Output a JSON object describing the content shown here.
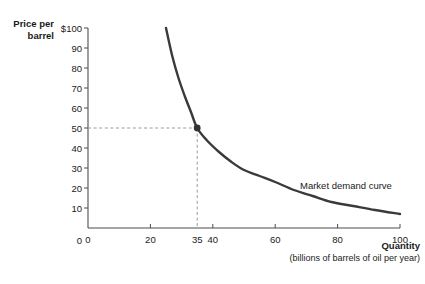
{
  "chart_data": {
    "type": "line",
    "title": "",
    "xlabel": "Quantity",
    "xlabel_sub": "(billions of barrels of oil per year)",
    "ylabel": "Price per\nbarrel",
    "xlim": [
      0,
      100
    ],
    "ylim": [
      0,
      100
    ],
    "grid": false,
    "legend_position": "inline-annotation",
    "annotations": [
      {
        "name": "market-demand-curve-label",
        "text": "Market demand curve",
        "x": 66,
        "y": 22
      }
    ],
    "x_ticks": [
      {
        "value": 0,
        "label": "0",
        "has_mark": false
      },
      {
        "value": 20,
        "label": "20",
        "has_mark": true
      },
      {
        "value": 35,
        "label": "35",
        "has_mark": false
      },
      {
        "value": 40,
        "label": "40",
        "has_mark": true
      },
      {
        "value": 60,
        "label": "60",
        "has_mark": true
      },
      {
        "value": 80,
        "label": "80",
        "has_mark": true
      },
      {
        "value": 100,
        "label": "100",
        "has_mark": true
      }
    ],
    "y_ticks": [
      {
        "value": 100,
        "label": "$100"
      },
      {
        "value": 90,
        "label": "90"
      },
      {
        "value": 80,
        "label": "80"
      },
      {
        "value": 70,
        "label": "70"
      },
      {
        "value": 60,
        "label": "60"
      },
      {
        "value": 50,
        "label": "50"
      },
      {
        "value": 40,
        "label": "40"
      },
      {
        "value": 30,
        "label": "30"
      },
      {
        "value": 20,
        "label": "20"
      },
      {
        "value": 10,
        "label": "10"
      },
      {
        "value": 0,
        "label": "0"
      }
    ],
    "series": [
      {
        "name": "Market demand curve",
        "color": "#3a3a3a",
        "points": [
          {
            "x": 25,
            "y": 100
          },
          {
            "x": 27,
            "y": 86
          },
          {
            "x": 29,
            "y": 75
          },
          {
            "x": 31,
            "y": 66
          },
          {
            "x": 33,
            "y": 58
          },
          {
            "x": 35,
            "y": 50
          },
          {
            "x": 38,
            "y": 44
          },
          {
            "x": 42,
            "y": 38
          },
          {
            "x": 46,
            "y": 33
          },
          {
            "x": 50,
            "y": 29
          },
          {
            "x": 55,
            "y": 26
          },
          {
            "x": 60,
            "y": 23
          },
          {
            "x": 66,
            "y": 19
          },
          {
            "x": 72,
            "y": 16
          },
          {
            "x": 78,
            "y": 13
          },
          {
            "x": 85,
            "y": 11
          },
          {
            "x": 92,
            "y": 9
          },
          {
            "x": 100,
            "y": 7
          }
        ]
      }
    ],
    "highlight_point": {
      "name": "equilibrium-point",
      "x": 35,
      "y": 50,
      "x_label": "35",
      "y_label": "50",
      "color": "#333333"
    },
    "guide_lines": {
      "horizontal_value": 50,
      "vertical_value": 35,
      "style": "dashed",
      "color": "#9a9a9a"
    },
    "colors": {
      "curve": "#3a3a3a",
      "axis": "#4d4d4d",
      "text": "#1a1a1a",
      "guide": "#9a9a9a",
      "background": "#ffffff"
    }
  }
}
